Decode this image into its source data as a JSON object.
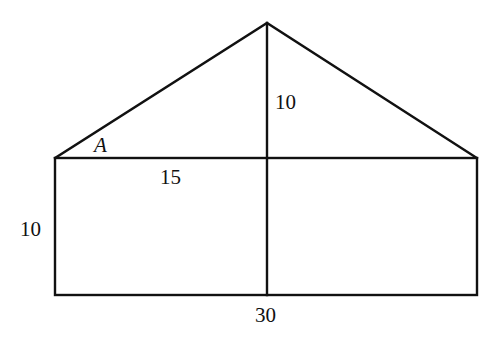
{
  "diagram": {
    "shapes": {
      "rectangle": {
        "width": 30,
        "height": 10
      },
      "triangle": {
        "base": 30,
        "height": 10
      }
    },
    "labels": {
      "angle": "A",
      "triangle_height": "10",
      "half_base": "15",
      "rect_height": "10",
      "base_width": "30"
    },
    "colors": {
      "stroke": "#111111",
      "background": "#ffffff"
    }
  }
}
